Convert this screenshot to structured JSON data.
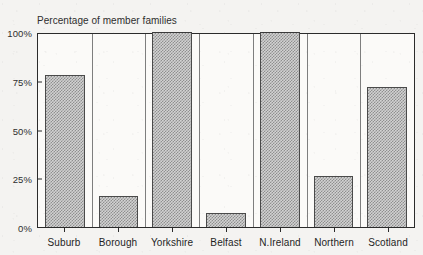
{
  "chart_title_cropped": "",
  "subtitle": "Percentage of member families",
  "chart_data": {
    "type": "bar",
    "title": "Percentage of member families",
    "subtitle": "Percentage of member families",
    "xlabel": "",
    "ylabel": "",
    "ylim": [
      0,
      100
    ],
    "grid": false,
    "legend": "none",
    "categories": [
      "Suburb",
      "Borough",
      "Yorkshire",
      "Belfast",
      "N.Ireland",
      "Northern",
      "Scotland"
    ],
    "values": [
      78,
      16,
      100,
      7,
      100,
      26,
      72
    ],
    "ytick_labels": [
      "0%",
      "25%",
      "50%",
      "75%",
      "100%"
    ],
    "ytick_values": [
      0,
      25,
      50,
      75,
      100
    ],
    "bar_fill": "#9a9a9a",
    "bar_pattern": "checkerboard-dither",
    "bar_outline": "#4a4a4a",
    "plot_background": "#fbfaf8",
    "axis_color": "#2b2b2b"
  }
}
